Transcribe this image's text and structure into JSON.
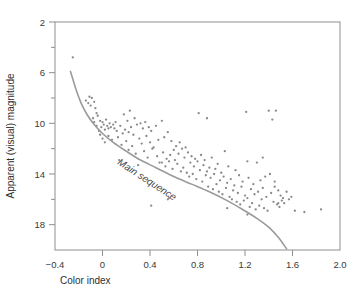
{
  "chart_data": {
    "type": "scatter",
    "title": "",
    "xlabel": "Color index",
    "ylabel": "Apparent (visual) magnitude",
    "xlim": [
      -0.4,
      2.0
    ],
    "ylim": [
      2,
      20
    ],
    "y_inverted": true,
    "grid": false,
    "legend": "none",
    "x_ticks": [
      "−0.4",
      "0",
      "0.4",
      "0.8",
      "1.2",
      "1.6",
      "2.0"
    ],
    "x_tick_values": [
      -0.4,
      0,
      0.4,
      0.8,
      1.2,
      1.6,
      2.0
    ],
    "y_ticks": [
      "2",
      "6",
      "10",
      "14",
      "18"
    ],
    "y_tick_values": [
      2,
      6,
      10,
      14,
      18
    ],
    "y_minor_tick_values": [
      4,
      8,
      12,
      16
    ],
    "point_color": "#8a8a8a",
    "curve_color": "#9a9a9a",
    "axis_color": "#8f8f8f",
    "annotations": [
      {
        "text": "Main sequence",
        "x": 0.12,
        "y": 13.2,
        "rotation": 33
      }
    ],
    "series": [
      {
        "name": "stars",
        "x": [
          -0.25,
          -0.14,
          -0.12,
          -0.11,
          -0.1,
          -0.09,
          -0.08,
          -0.07,
          -0.07,
          -0.06,
          -0.05,
          -0.05,
          -0.04,
          -0.03,
          -0.02,
          -0.02,
          -0.01,
          0.0,
          0.0,
          0.01,
          0.02,
          0.02,
          0.03,
          0.04,
          0.05,
          0.05,
          0.06,
          0.07,
          0.08,
          0.09,
          0.1,
          0.11,
          0.12,
          0.13,
          0.14,
          0.15,
          0.16,
          0.17,
          0.18,
          0.19,
          0.2,
          0.21,
          0.22,
          0.22,
          0.23,
          0.24,
          0.25,
          0.26,
          0.27,
          0.28,
          0.29,
          0.3,
          0.31,
          0.32,
          0.33,
          0.34,
          0.35,
          0.36,
          0.37,
          0.38,
          0.39,
          0.4,
          0.41,
          0.42,
          0.43,
          0.45,
          0.46,
          0.47,
          0.48,
          0.5,
          0.51,
          0.52,
          0.53,
          0.54,
          0.55,
          0.56,
          0.57,
          0.58,
          0.59,
          0.6,
          0.61,
          0.62,
          0.63,
          0.64,
          0.65,
          0.66,
          0.67,
          0.68,
          0.69,
          0.7,
          0.71,
          0.72,
          0.73,
          0.74,
          0.75,
          0.76,
          0.77,
          0.78,
          0.79,
          0.8,
          0.81,
          0.82,
          0.83,
          0.84,
          0.85,
          0.86,
          0.87,
          0.88,
          0.89,
          0.9,
          0.91,
          0.92,
          0.93,
          0.94,
          0.95,
          0.96,
          0.97,
          0.98,
          0.99,
          1.0,
          1.01,
          1.02,
          1.03,
          1.04,
          1.05,
          1.06,
          1.07,
          1.08,
          1.09,
          1.1,
          1.11,
          1.12,
          1.13,
          1.14,
          1.15,
          1.16,
          1.17,
          1.18,
          1.19,
          1.2,
          1.21,
          1.22,
          1.22,
          1.23,
          1.24,
          1.25,
          1.26,
          1.27,
          1.28,
          1.29,
          1.3,
          1.31,
          1.32,
          1.33,
          1.34,
          1.35,
          1.36,
          1.37,
          1.38,
          1.39,
          1.4,
          1.41,
          1.42,
          1.43,
          1.44,
          1.45,
          1.46,
          1.47,
          1.48,
          1.49,
          1.5,
          1.51,
          1.52,
          1.53,
          1.55,
          1.57,
          1.59,
          1.62,
          1.7,
          1.84,
          0.41,
          0.55,
          0.56,
          0.88,
          1.22,
          1.45,
          1.48,
          1.35,
          1.05,
          0.5
        ],
        "y": [
          4.8,
          8.2,
          8.4,
          7.9,
          8.6,
          8.0,
          9.6,
          8.3,
          9.9,
          8.8,
          9.2,
          10.2,
          9.4,
          10.6,
          9.8,
          10.9,
          10.3,
          9.9,
          11.2,
          10.1,
          10.5,
          11.5,
          9.7,
          10.2,
          11.0,
          10.4,
          10.0,
          10.3,
          11.3,
          10.1,
          10.4,
          9.9,
          10.6,
          11.1,
          12.9,
          10.2,
          11.7,
          10.8,
          9.3,
          10.5,
          11.4,
          9.8,
          12.1,
          10.7,
          9.0,
          10.3,
          11.8,
          10.9,
          9.6,
          12.4,
          10.1,
          13.3,
          11.2,
          10.0,
          11.6,
          10.4,
          12.2,
          9.9,
          11.0,
          12.7,
          10.3,
          11.5,
          10.6,
          12.0,
          11.9,
          10.2,
          12.6,
          11.3,
          13.1,
          9.8,
          12.3,
          11.1,
          13.4,
          12.8,
          10.7,
          13.0,
          12.5,
          11.4,
          13.6,
          12.1,
          12.9,
          11.8,
          13.2,
          12.4,
          11.5,
          13.8,
          12.0,
          13.5,
          12.7,
          11.9,
          13.9,
          12.3,
          14.2,
          13.1,
          12.6,
          14.0,
          13.4,
          12.8,
          14.4,
          13.0,
          9.2,
          13.7,
          12.5,
          14.6,
          13.3,
          12.9,
          14.1,
          13.8,
          15.0,
          13.5,
          14.3,
          12.7,
          15.2,
          14.0,
          13.6,
          14.8,
          13.2,
          15.4,
          14.5,
          13.9,
          15.6,
          14.2,
          12.2,
          15.1,
          14.7,
          13.4,
          15.8,
          14.4,
          16.0,
          15.3,
          14.9,
          13.7,
          16.2,
          15.5,
          14.1,
          16.4,
          15.0,
          14.6,
          16.1,
          15.7,
          9.1,
          13.0,
          15.9,
          14.3,
          16.6,
          15.2,
          16.3,
          14.8,
          15.6,
          16.8,
          13.1,
          15.4,
          16.5,
          14.5,
          16.0,
          15.1,
          16.7,
          14.2,
          15.8,
          16.9,
          9.0,
          14.0,
          15.5,
          9.7,
          16.2,
          15.0,
          9.0,
          16.4,
          15.3,
          16.6,
          15.7,
          16.1,
          15.9,
          16.3,
          15.4,
          16.0,
          15.8,
          16.9,
          17.0,
          16.8,
          16.5,
          16.0,
          15.9,
          9.6,
          17.2,
          14.6,
          16.3,
          12.7,
          16.7,
          13.1
        ]
      }
    ],
    "curve": {
      "name": "Main sequence",
      "x": [
        -0.27,
        -0.25,
        -0.22,
        -0.18,
        -0.13,
        -0.07,
        0.0,
        0.09,
        0.2,
        0.32,
        0.45,
        0.6,
        0.75,
        0.9,
        1.05,
        1.18,
        1.3,
        1.4,
        1.48,
        1.55
      ],
      "y": [
        5.9,
        6.5,
        7.4,
        8.4,
        9.3,
        10.1,
        10.8,
        11.5,
        12.2,
        12.9,
        13.5,
        14.2,
        14.8,
        15.4,
        16.1,
        16.8,
        17.5,
        18.2,
        19.0,
        19.9
      ]
    }
  }
}
